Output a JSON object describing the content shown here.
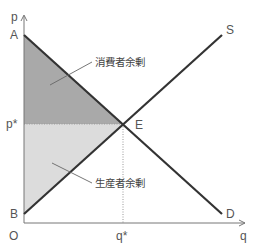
{
  "diagram": {
    "type": "supply-demand-surplus",
    "axes": {
      "y_label": "p",
      "x_label": "q",
      "origin_label": "O"
    },
    "points": {
      "A": "A",
      "B": "B",
      "E": "E",
      "S": "S",
      "D": "D",
      "p_star": "p*",
      "q_star": "q*"
    },
    "regions": {
      "consumer_surplus": {
        "label": "消費者余剰",
        "color": "#a9a9a9"
      },
      "producer_surplus": {
        "label": "生産者余剰",
        "color": "#dcdcdc"
      }
    },
    "colors": {
      "curve": "#333333",
      "axis": "#777777",
      "guide": "#999999"
    }
  }
}
